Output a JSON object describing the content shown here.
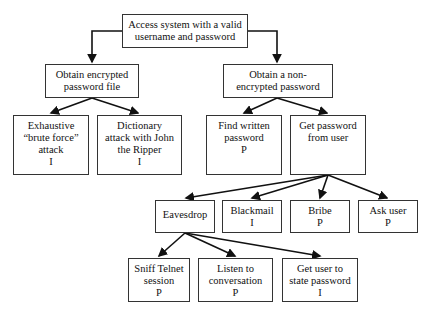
{
  "legend_marks": {
    "P": "possible",
    "I": "impossible"
  },
  "nodes": {
    "root": "Access system with a valid\nusername and password",
    "enc": "Obtain encrypted\npassword file",
    "nonenc": "Obtain a non-\nencrypted password",
    "brute": "Exhaustive\n“brute force”\nattack\nI",
    "dict": "Dictionary\nattack with John\nthe Ripper\nI",
    "written": "Find written\npassword\nP",
    "fromuser": "Get password\nfrom user",
    "eaves": "Eavesdrop",
    "blackmail": "Blackmail\nI",
    "bribe": "Bribe\nP",
    "ask": "Ask user\nP",
    "sniff": "Sniff Telnet\nsession\nP",
    "listen": "Listen to\nconversation\nP",
    "state": "Get user to\nstate password\nI"
  }
}
